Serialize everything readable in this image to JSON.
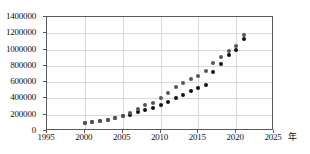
{
  "chart_data": {
    "type": "scatter",
    "title": "",
    "subtitle": "",
    "xlabel": "年",
    "ylabel": "",
    "xlim": [
      1995,
      2025
    ],
    "ylim": [
      0,
      1400000
    ],
    "grid": true,
    "legend": "none",
    "x_ticks": [
      1995,
      2000,
      2005,
      2010,
      2015,
      2020,
      2025
    ],
    "y_ticks": [
      0,
      200000,
      400000,
      600000,
      800000,
      1000000,
      1200000,
      1400000
    ],
    "x": [
      2000,
      2001,
      2002,
      2003,
      2004,
      2005,
      2006,
      2007,
      2008,
      2009,
      2010,
      2011,
      2012,
      2013,
      2014,
      2015,
      2016,
      2017,
      2018,
      2019,
      2020,
      2021
    ],
    "series": [
      {
        "name": "series-a",
        "color": "#111111",
        "values": [
          100000,
          108000,
          118000,
          133000,
          158000,
          182000,
          202000,
          228000,
          262000,
          282000,
          315000,
          357000,
          400000,
          440000,
          495000,
          525000,
          570000,
          720000,
          820000,
          930000,
          1000000,
          1125000
        ]
      },
      {
        "name": "series-b",
        "color": "#555555",
        "values": [
          100000,
          110000,
          120000,
          135000,
          160000,
          185000,
          215000,
          272000,
          318000,
          350000,
          408000,
          468000,
          535000,
          590000,
          640000,
          680000,
          740000,
          832000,
          905000,
          985000,
          1040000,
          1185000
        ]
      }
    ]
  },
  "axis": {
    "x_unit_label": "年"
  }
}
